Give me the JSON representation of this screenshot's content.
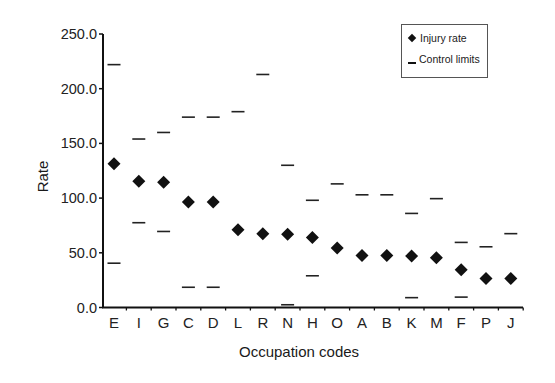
{
  "chart_data": {
    "type": "scatter",
    "title": "",
    "xlabel": "Occupation codes",
    "ylabel": "Rate",
    "ylim": [
      0,
      250
    ],
    "yticks": [
      "0.0",
      "50.0",
      "100.0",
      "150.0",
      "200.0",
      "250.0"
    ],
    "grid": false,
    "legend_position": "upper right",
    "legend": [
      "Injury rate",
      "Control limits"
    ],
    "categories": [
      "E",
      "I",
      "G",
      "C",
      "D",
      "L",
      "R",
      "N",
      "H",
      "O",
      "A",
      "B",
      "K",
      "M",
      "F",
      "P",
      "J"
    ],
    "series": [
      {
        "name": "Injury rate",
        "marker": "diamond",
        "values": [
          131.5,
          115.5,
          114.5,
          96.5,
          96.5,
          71.0,
          67.5,
          67.0,
          64.0,
          54.5,
          47.5,
          47.5,
          47.0,
          45.5,
          34.5,
          26.5,
          26.5
        ]
      },
      {
        "name": "Upper control limit",
        "marker": "dash",
        "values": [
          222,
          154,
          160,
          174,
          174,
          179,
          213,
          130,
          98,
          113,
          103,
          103,
          86,
          99.5,
          59.5,
          55.5,
          67.5
        ]
      },
      {
        "name": "Lower control limit",
        "marker": "dash",
        "values": [
          40.5,
          77.5,
          69.5,
          18.5,
          18.5,
          null,
          null,
          2.5,
          29.0,
          null,
          null,
          null,
          9.0,
          null,
          9.5,
          null,
          null
        ]
      }
    ]
  },
  "labels": {
    "xlabel": "Occupation codes",
    "ylabel": "Rate",
    "legend_injury": "Injury rate",
    "legend_control": "Control limits"
  }
}
